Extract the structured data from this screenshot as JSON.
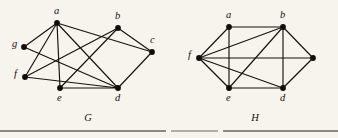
{
  "figure": {
    "background_color": "#f7f4ed",
    "ink_color": "#16120f",
    "graphs": [
      {
        "id": "G",
        "caption": "G",
        "caption_position": {
          "x": 88,
          "y": 121
        },
        "vertices": [
          {
            "id": "a",
            "label": "a",
            "x": 57,
            "y": 23,
            "label_x": 54,
            "label_y": 14,
            "radius": 2.9
          },
          {
            "id": "b",
            "label": "b",
            "x": 118,
            "y": 28,
            "label_x": 115,
            "label_y": 19,
            "radius": 2.9
          },
          {
            "id": "c",
            "label": "c",
            "x": 152,
            "y": 52,
            "label_x": 150,
            "label_y": 43,
            "radius": 2.9
          },
          {
            "id": "g",
            "label": "g",
            "x": 24,
            "y": 47,
            "label_x": 12,
            "label_y": 47,
            "radius": 2.9
          },
          {
            "id": "f",
            "label": "f",
            "x": 25,
            "y": 77,
            "label_x": 14,
            "label_y": 77,
            "radius": 2.9
          },
          {
            "id": "e",
            "label": "e",
            "x": 60,
            "y": 88,
            "label_x": 57,
            "label_y": 101,
            "radius": 2.9
          },
          {
            "id": "d",
            "label": "d",
            "x": 118,
            "y": 88,
            "label_x": 115,
            "label_y": 101,
            "radius": 2.9
          }
        ],
        "edges": [
          {
            "from": "a",
            "to": "g"
          },
          {
            "from": "a",
            "to": "f"
          },
          {
            "from": "a",
            "to": "e"
          },
          {
            "from": "a",
            "to": "d"
          },
          {
            "from": "a",
            "to": "c"
          },
          {
            "from": "b",
            "to": "f"
          },
          {
            "from": "b",
            "to": "e"
          },
          {
            "from": "b",
            "to": "c"
          },
          {
            "from": "g",
            "to": "d"
          },
          {
            "from": "f",
            "to": "d"
          },
          {
            "from": "e",
            "to": "d"
          },
          {
            "from": "c",
            "to": "d"
          }
        ]
      },
      {
        "id": "H",
        "caption": "H",
        "caption_position": {
          "x": 255,
          "y": 121
        },
        "vertices": [
          {
            "id": "a",
            "label": "a",
            "x": 229,
            "y": 27,
            "label_x": 226,
            "label_y": 18,
            "radius": 2.9
          },
          {
            "id": "b",
            "label": "b",
            "x": 283,
            "y": 27,
            "label_x": 280,
            "label_y": 18,
            "radius": 2.9
          },
          {
            "id": "f",
            "label": "f",
            "x": 199,
            "y": 58,
            "label_x": 188,
            "label_y": 58,
            "radius": 2.9
          },
          {
            "id": "r",
            "label": "",
            "x": 313,
            "y": 58,
            "label_x": 321,
            "label_y": 58,
            "radius": 2.9
          },
          {
            "id": "e",
            "label": "e",
            "x": 229,
            "y": 88,
            "label_x": 226,
            "label_y": 101,
            "radius": 2.9
          },
          {
            "id": "d",
            "label": "d",
            "x": 283,
            "y": 88,
            "label_x": 280,
            "label_y": 101,
            "radius": 2.9
          }
        ],
        "edges": [
          {
            "from": "f",
            "to": "a"
          },
          {
            "from": "f",
            "to": "b"
          },
          {
            "from": "f",
            "to": "e"
          },
          {
            "from": "f",
            "to": "d"
          },
          {
            "from": "f",
            "to": "r"
          },
          {
            "from": "a",
            "to": "b"
          },
          {
            "from": "a",
            "to": "e"
          },
          {
            "from": "b",
            "to": "e"
          },
          {
            "from": "b",
            "to": "d"
          },
          {
            "from": "b",
            "to": "r"
          },
          {
            "from": "e",
            "to": "d"
          },
          {
            "from": "d",
            "to": "r"
          }
        ]
      }
    ],
    "rules": [
      {
        "name": "rule-left",
        "x1": 0,
        "y1": 131,
        "x2": 166,
        "y2": 131,
        "weight": "thick"
      },
      {
        "name": "rule-middle",
        "x1": 171,
        "y1": 131,
        "x2": 218,
        "y2": 131,
        "weight": "thin"
      },
      {
        "name": "rule-right",
        "x1": 223,
        "y1": 131,
        "x2": 338,
        "y2": 131,
        "weight": "thick"
      }
    ]
  }
}
